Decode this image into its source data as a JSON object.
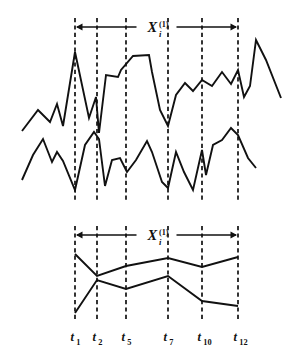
{
  "figure": {
    "title": "",
    "width": 306,
    "height": 358,
    "background": "#ffffff",
    "stroke_color": "#111111"
  },
  "chart_data": {
    "type": "line",
    "title": "",
    "xlabel": "",
    "ylabel": "",
    "grid": false,
    "legend_position": "none",
    "panels": [
      {
        "name": "raw-multivariate-time-series",
        "description": "Top panel: two raw time series traces with dashed vertical segmentation cut lines",
        "xlim": [
          0,
          306
        ],
        "ylim": [
          195,
          30
        ],
        "series": [
          {
            "name": "upper-trace",
            "points": [
              [
                22,
                131
              ],
              [
                38,
                110
              ],
              [
                50,
                122
              ],
              [
                57,
                104
              ],
              [
                63,
                126
              ],
              [
                75,
                52
              ],
              [
                89,
                118
              ],
              [
                96,
                97
              ],
              [
                99,
                133
              ],
              [
                106,
                75
              ],
              [
                118,
                77
              ],
              [
                121,
                70
              ],
              [
                133,
                56
              ],
              [
                149,
                55
              ],
              [
                152,
                72
              ],
              [
                160,
                110
              ],
              [
                168,
                126
              ],
              [
                176,
                95
              ],
              [
                185,
                83
              ],
              [
                193,
                91
              ],
              [
                202,
                80
              ],
              [
                212,
                86
              ],
              [
                222,
                72
              ],
              [
                231,
                84
              ],
              [
                238,
                70
              ],
              [
                244,
                97
              ],
              [
                250,
                86
              ],
              [
                256,
                40
              ],
              [
                266,
                60
              ],
              [
                281,
                98
              ]
            ]
          },
          {
            "name": "lower-trace",
            "points": [
              [
                22,
                180
              ],
              [
                33,
                155
              ],
              [
                43,
                139
              ],
              [
                52,
                162
              ],
              [
                57,
                152
              ],
              [
                63,
                161
              ],
              [
                75,
                190
              ],
              [
                85,
                145
              ],
              [
                94,
                132
              ],
              [
                99,
                139
              ],
              [
                105,
                186
              ],
              [
                112,
                160
              ],
              [
                120,
                158
              ],
              [
                127,
                172
              ],
              [
                136,
                160
              ],
              [
                147,
                141
              ],
              [
                152,
                152
              ],
              [
                162,
                182
              ],
              [
                168,
                188
              ],
              [
                176,
                152
              ],
              [
                184,
                172
              ],
              [
                193,
                190
              ],
              [
                202,
                150
              ],
              [
                206,
                175
              ],
              [
                213,
                145
              ],
              [
                222,
                140
              ],
              [
                231,
                128
              ],
              [
                238,
                135
              ],
              [
                248,
                158
              ],
              [
                256,
                168
              ]
            ]
          }
        ]
      },
      {
        "name": "segmented-feature-series",
        "description": "Bottom panel: two smoothed traces sampled at the cut times t1,t2,t5,t7,t10,t12",
        "xlim": [
          60,
          250
        ],
        "ylim": [
          315,
          250
        ],
        "series": [
          {
            "name": "upper-trace",
            "points": [
              [
                75,
                254
              ],
              [
                97,
                276
              ],
              [
                126,
                266
              ],
              [
                168,
                258
              ],
              [
                202,
                267
              ],
              [
                238,
                257
              ]
            ]
          },
          {
            "name": "lower-trace",
            "points": [
              [
                75,
                313
              ],
              [
                97,
                280
              ],
              [
                126,
                289
              ],
              [
                168,
                276
              ],
              [
                202,
                301
              ],
              [
                238,
                306
              ]
            ]
          }
        ]
      }
    ],
    "cut_lines": {
      "x_positions": [
        75,
        97,
        126,
        168,
        202,
        238
      ],
      "style": "dashed",
      "top_panel_y": [
        18,
        200
      ],
      "bottom_panel_y": [
        226,
        320
      ]
    },
    "tick_labels": [
      {
        "base": "t",
        "sub": "1",
        "x": 75
      },
      {
        "base": "t",
        "sub": "2",
        "x": 97
      },
      {
        "base": "t",
        "sub": "5",
        "x": 126
      },
      {
        "base": "t",
        "sub": "7",
        "x": 168
      },
      {
        "base": "t",
        "sub": "10",
        "x": 202
      },
      {
        "base": "t",
        "sub": "12",
        "x": 238
      }
    ],
    "annotations": [
      {
        "name": "top-span-label",
        "base": "X",
        "superscript": "(1)",
        "subscript": "i",
        "arrow_from_x": 75,
        "arrow_to_x": 238,
        "arrow_y": 27
      },
      {
        "name": "bottom-span-label",
        "base": "X",
        "superscript": "(1)",
        "subscript": "i",
        "arrow_from_x": 75,
        "arrow_to_x": 238,
        "arrow_y": 235
      }
    ]
  }
}
